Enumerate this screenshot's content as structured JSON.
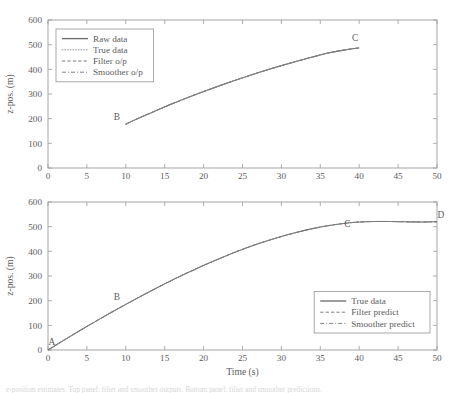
{
  "figure": {
    "background_color": "#ffffff",
    "line_color": "#6e6e6e",
    "axis_color": "#9b9b9b"
  },
  "caption": {
    "text": "z-position estimates. Top panel: filter and smoother outputs. Bottom panel: filter and smoother predictions."
  },
  "chart_data": [
    {
      "type": "line",
      "panel": "top",
      "title": "",
      "xlabel": "",
      "ylabel": "z-pos. (m)",
      "xlim": [
        0,
        50
      ],
      "ylim": [
        0,
        600
      ],
      "xticks": [
        0,
        5,
        10,
        15,
        20,
        25,
        30,
        35,
        40,
        45,
        50
      ],
      "yticks": [
        0,
        100,
        200,
        300,
        400,
        500,
        600
      ],
      "grid": false,
      "legend_position": "upper-left",
      "legend": [
        "Raw data",
        "True data",
        "Filter o/p",
        "Smoother o/p"
      ],
      "x": [
        10,
        12,
        14,
        16,
        18,
        20,
        22,
        24,
        26,
        28,
        30,
        32,
        34,
        36,
        38,
        40
      ],
      "series": [
        {
          "name": "Raw data",
          "style": "solid",
          "values": [
            178,
            207,
            234,
            261,
            286,
            310,
            333,
            355,
            376,
            396,
            415,
            433,
            450,
            466,
            478,
            487
          ]
        },
        {
          "name": "True data",
          "style": "dotted",
          "values": [
            178,
            207,
            234,
            261,
            286,
            310,
            333,
            355,
            376,
            396,
            415,
            433,
            450,
            466,
            478,
            487
          ]
        },
        {
          "name": "Filter o/p",
          "style": "dashed",
          "values": [
            178,
            207,
            234,
            261,
            286,
            310,
            333,
            355,
            376,
            396,
            415,
            433,
            450,
            466,
            478,
            487
          ]
        },
        {
          "name": "Smoother o/p",
          "style": "dashdot",
          "values": [
            178,
            207,
            234,
            261,
            286,
            310,
            333,
            355,
            376,
            396,
            415,
            433,
            450,
            466,
            478,
            487
          ]
        }
      ],
      "annotations": [
        {
          "label": "B",
          "x": 10,
          "y": 178
        },
        {
          "label": "C",
          "x": 40,
          "y": 487
        }
      ]
    },
    {
      "type": "line",
      "panel": "bottom",
      "title": "",
      "xlabel": "Time (s)",
      "ylabel": "z-pos. (m)",
      "xlim": [
        0,
        50
      ],
      "ylim": [
        0,
        600
      ],
      "xticks": [
        0,
        5,
        10,
        15,
        20,
        25,
        30,
        35,
        40,
        45,
        50
      ],
      "yticks": [
        0,
        100,
        200,
        300,
        400,
        500,
        600
      ],
      "grid": false,
      "legend_position": "lower-right",
      "legend": [
        "True data",
        "Filter predict",
        "Smoother predict"
      ],
      "x": [
        0,
        2,
        4,
        6,
        8,
        10,
        12,
        14,
        16,
        18,
        20,
        22,
        24,
        26,
        28,
        30,
        32,
        34,
        36,
        38,
        40,
        42,
        44,
        46,
        48,
        50
      ],
      "series": [
        {
          "name": "True data",
          "style": "solid",
          "values": [
            0,
            39,
            77,
            114,
            150,
            185,
            219,
            252,
            284,
            314,
            343,
            370,
            396,
            420,
            441,
            460,
            477,
            492,
            504,
            513,
            519,
            521,
            521,
            520,
            519,
            520
          ]
        },
        {
          "name": "Filter predict",
          "style": "dashed",
          "values": [
            0,
            39,
            77,
            114,
            150,
            185,
            219,
            252,
            284,
            314,
            343,
            370,
            396,
            420,
            441,
            460,
            477,
            492,
            504,
            513,
            519,
            521,
            521,
            520,
            519,
            520
          ]
        },
        {
          "name": "Smoother predict",
          "style": "dashdot",
          "values": [
            0,
            39,
            77,
            114,
            150,
            185,
            219,
            252,
            284,
            314,
            343,
            370,
            396,
            420,
            441,
            460,
            477,
            492,
            504,
            513,
            519,
            521,
            521,
            520,
            519,
            520
          ]
        }
      ],
      "annotations": [
        {
          "label": "A",
          "x": 0,
          "y": 0
        },
        {
          "label": "B",
          "x": 10,
          "y": 185
        },
        {
          "label": "C",
          "x": 39,
          "y": 470
        },
        {
          "label": "D",
          "x": 50,
          "y": 520
        }
      ]
    }
  ]
}
